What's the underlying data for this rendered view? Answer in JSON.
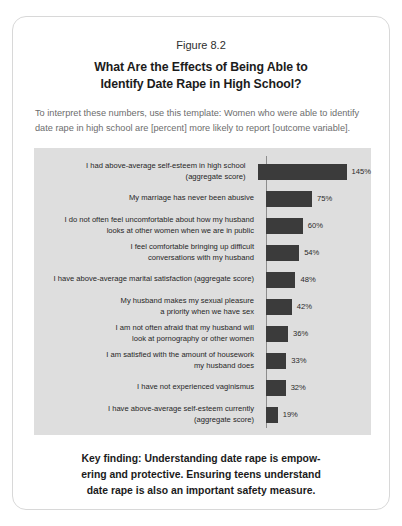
{
  "figure": {
    "number": "Figure 8.2",
    "title_lines": [
      "What Are the Effects of Being Able to",
      "Identify Date Rape in High School?"
    ],
    "intro_lines": [
      "To interpret these numbers, use this template: Women who were able to identify",
      "date rape in high school are [percent] more likely to report [outcome variable]."
    ],
    "footer_lines": [
      "Key finding: Understanding date rape is empow-",
      "ering and protective. Ensuring teens understand",
      "date rape is also an important safety measure."
    ]
  },
  "chart_data": {
    "type": "bar",
    "orientation": "horizontal",
    "title": "What Are the Effects of Being Able to Identify Date Rape in High School?",
    "subtitle": "Figure 8.2",
    "xlabel": "",
    "ylabel": "",
    "xlim": [
      0,
      145
    ],
    "grid": false,
    "legend": "none",
    "value_suffix": "%",
    "bar_color": "#3b3b3b",
    "panel_color": "#dedede",
    "axis_color": "#8d8d8d",
    "categories": [
      "I had above-average self-esteem in high school (aggregate score)",
      "My marriage has never been abusive",
      "I do not often feel uncomfortable about how my husband looks at other women when we are in public",
      "I feel comfortable bringing up difficult conversations with my husband",
      "I have above-average marital satisfaction (aggregate score)",
      "My husband makes my sexual pleasure a priority when we have sex",
      "I am not often afraid that my husband will look at pornography or other women",
      "I am satisfied with the amount of housework my husband does",
      "I have not experienced vaginismus",
      "I have above-average self-esteem currently (aggregate score)"
    ],
    "values": [
      145,
      75,
      60,
      54,
      48,
      42,
      36,
      33,
      32,
      19
    ],
    "value_labels": [
      "145%",
      "75%",
      "60%",
      "54%",
      "48%",
      "42%",
      "36%",
      "33%",
      "32%",
      "19%"
    ],
    "category_lines": [
      [
        "I had above-average self-esteem in high school",
        "(aggregate score)"
      ],
      [
        "My marriage has never been abusive"
      ],
      [
        "I do not often feel uncomfortable about how my husband",
        "looks at other women when we are in public"
      ],
      [
        "I feel comfortable bringing up difficult",
        "conversations with my husband"
      ],
      [
        "I have above-average marital satisfaction (aggregate score)"
      ],
      [
        "My husband makes my sexual pleasure",
        "a priority when we have sex"
      ],
      [
        "I am not often afraid that my husband will",
        "look at pornography or other women"
      ],
      [
        "I am satisfied with the amount of housework",
        "my husband does"
      ],
      [
        "I have not experienced vaginismus"
      ],
      [
        "I have above-average self-esteem currently",
        "(aggregate score)"
      ]
    ]
  }
}
